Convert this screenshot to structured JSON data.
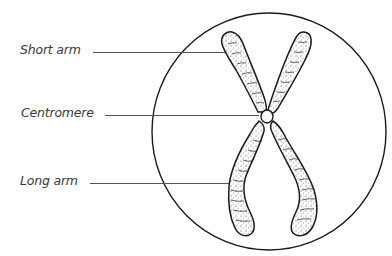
{
  "diagram": {
    "labels": [
      {
        "id": "short-arm",
        "text": "Short arm"
      },
      {
        "id": "centromere",
        "text": "Centromere"
      },
      {
        "id": "long-arm",
        "text": "Long arm"
      }
    ],
    "colors": {
      "stroke": "#1a1a1a",
      "label_text": "#3a3a3a",
      "leader_line": "#555555",
      "background": "#ffffff"
    }
  }
}
